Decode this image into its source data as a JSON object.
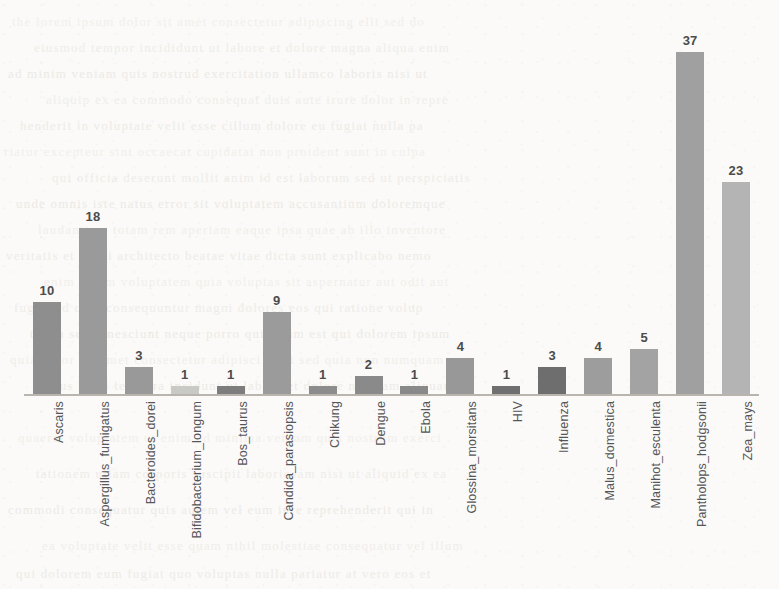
{
  "page": {
    "background_color": "#fbfaf8",
    "width": 779,
    "height": 589
  },
  "chart_data": {
    "type": "bar",
    "title": "",
    "subtitle": "",
    "xlabel": "",
    "ylabel": "",
    "ylim": [
      0,
      40
    ],
    "grid": false,
    "legend": "none",
    "data_labels": true,
    "orientation": "vertical",
    "tick_label_rotation": -90,
    "categories": [
      "Ascaris",
      "Aspergillus_fumigatus",
      "Bacteroides_dorei",
      "Bifidobacterium_longum",
      "Bos_taurus",
      "Candida_parasiopsis",
      "Chikung",
      "Dengue",
      "Ebola",
      "Glossina_morsitans",
      "HIV",
      "Influenza",
      "Malus_domestica",
      "Manihot_esculenta",
      "Pantholops_hodgsonii",
      "Zea_mays"
    ],
    "values": [
      10,
      18,
      3,
      1,
      1,
      9,
      1,
      2,
      1,
      4,
      1,
      3,
      4,
      5,
      37,
      23
    ],
    "bar_colors": [
      "#8e8e8e",
      "#9a9a9a",
      "#999999",
      "#c9c9c6",
      "#7d7d7d",
      "#9b9b9b",
      "#8c8c8c",
      "#8a8a8a",
      "#898989",
      "#989898",
      "#6f6f6f",
      "#6e6e6e",
      "#9d9d9d",
      "#a3a3a3",
      "#a0a0a0",
      "#b4b4b4"
    ],
    "axis_color": "#b9b5ae",
    "label_color": "#55565a",
    "value_label_color": "#4b4b4b"
  },
  "background_bleed": [
    {
      "text": "the  lorem  ipsum  dolor  sit  amet  consectetur  adipiscing  elit  sed  do",
      "left": 12,
      "top": 14,
      "size": 13
    },
    {
      "text": "eiusmod  tempor  incididunt  ut  labore  et  dolore  magna  aliqua  enim",
      "left": 34,
      "top": 40,
      "size": 13
    },
    {
      "text": "ad  minim  veniam  quis  nostrud  exercitation  ullamco  laboris  nisi  ut",
      "left": 8,
      "top": 66,
      "size": 13
    },
    {
      "text": "aliquip  ex  ea  commodo  consequat  duis  aute  irure  dolor  in  repre",
      "left": 46,
      "top": 92,
      "size": 13
    },
    {
      "text": "henderit  in  voluptate  velit  esse  cillum  dolore  eu  fugiat  nulla  pa",
      "left": 20,
      "top": 118,
      "size": 13
    },
    {
      "text": "riatur  excepteur  sint  occaecat  cupidatat  non  proident  sunt  in  culpa",
      "left": 4,
      "top": 144,
      "size": 13
    },
    {
      "text": "qui  officia  deserunt  mollit  anim  id  est  laborum  sed  ut  perspiciatis",
      "left": 52,
      "top": 170,
      "size": 13
    },
    {
      "text": "unde  omnis  iste  natus  error  sit  voluptatem  accusantium  doloremque",
      "left": 16,
      "top": 196,
      "size": 13
    },
    {
      "text": "laudantium  totam  rem  aperiam  eaque  ipsa  quae  ab  illo  inventore",
      "left": 38,
      "top": 222,
      "size": 13
    },
    {
      "text": "veritatis  et  quasi  architecto  beatae  vitae  dicta  sunt  explicabo  nemo",
      "left": 6,
      "top": 248,
      "size": 13
    },
    {
      "text": "enim  ipsam  voluptatem  quia  voluptas  sit  aspernatur  aut  odit  aut",
      "left": 44,
      "top": 274,
      "size": 13
    },
    {
      "text": "fugit  sed  quia  consequuntur  magni  dolores  eos  qui  ratione  volup",
      "left": 14,
      "top": 300,
      "size": 13
    },
    {
      "text": "tatem  sequi  nesciunt  neque  porro  quisquam  est  qui  dolorem  ipsum",
      "left": 30,
      "top": 326,
      "size": 13
    },
    {
      "text": "quia  dolor  sit  amet  consectetur  adipisci  velit  sed  quia  non  numquam",
      "left": 10,
      "top": 352,
      "size": 13
    },
    {
      "text": "eius  modi  tempora  incidunt  ut  labore  et  dolore  magnam  aliquam",
      "left": 48,
      "top": 378,
      "size": 13
    },
    {
      "text": "quaerat  voluptatem  ut  enim  ad  minima  veniam  quis  nostrum  exerci",
      "left": 18,
      "top": 430,
      "size": 13
    },
    {
      "text": "tationem  ullam  corporis  suscipit  laboriosam  nisi  ut  aliquid  ex  ea",
      "left": 36,
      "top": 466,
      "size": 13
    },
    {
      "text": "commodi  consequatur  quis  autem  vel  eum  iure  reprehenderit  qui  in",
      "left": 8,
      "top": 502,
      "size": 13
    },
    {
      "text": "ea  voluptate  velit  esse  quam  nihil  molestiae  consequatur  vel  illum",
      "left": 42,
      "top": 538,
      "size": 13
    },
    {
      "text": "qui  dolorem  eum  fugiat  quo  voluptas  nulla  pariatur  at  vero  eos  et",
      "left": 16,
      "top": 566,
      "size": 13
    }
  ]
}
